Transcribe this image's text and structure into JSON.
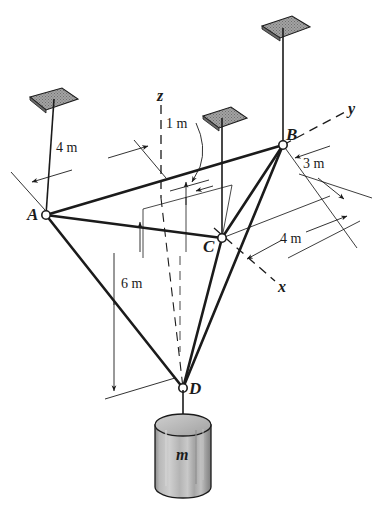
{
  "figure": {
    "background_color": "#ffffff",
    "line_color": "#1b1b1b",
    "plate_fill_color": "#9a9a9a",
    "cylinder_fill_color": "#b5b5b5"
  },
  "points": {
    "a": {
      "label": "A",
      "x": 46,
      "y": 215
    },
    "b": {
      "label": "B",
      "x": 283,
      "y": 145
    },
    "c": {
      "label": "C",
      "x": 222,
      "y": 238
    },
    "d": {
      "label": "D",
      "x": 183,
      "y": 388
    }
  },
  "axes": [
    {
      "name": "z-axis",
      "label": "z",
      "x": 161,
      "y": 97
    },
    {
      "name": "y-axis",
      "label": "y",
      "x": 351,
      "y": 110
    },
    {
      "name": "x-axis",
      "label": "x",
      "x": 281,
      "y": 287
    }
  ],
  "dimensions": [
    {
      "name": "dim-4m-ab",
      "label": "4 m",
      "x": 73,
      "y": 148
    },
    {
      "name": "dim-1m-offset",
      "label": "1 m",
      "x": 169,
      "y": 124
    },
    {
      "name": "dim-3m-b",
      "label": "3 m",
      "x": 315,
      "y": 165
    },
    {
      "name": "dim-4m-x",
      "label": "4 m",
      "x": 288,
      "y": 239
    },
    {
      "name": "dim-6m-depth",
      "label": "6 m",
      "x": 121,
      "y": 283
    }
  ],
  "mass": {
    "label": "m",
    "label_x": 176,
    "label_y": 455
  },
  "supports": [
    {
      "name": "ceiling-plate-left",
      "anchor_x": 54,
      "anchor_y": 101
    },
    {
      "name": "ceiling-plate-mid",
      "anchor_x": 222,
      "anchor_y": 120
    },
    {
      "name": "ceiling-plate-right",
      "anchor_x": 283,
      "anchor_y": 30
    }
  ],
  "members": [
    {
      "name": "cable-a-b",
      "from": "A",
      "to": "B"
    },
    {
      "name": "cable-a-c",
      "from": "A",
      "to": "C"
    },
    {
      "name": "cable-b-c",
      "from": "B",
      "to": "C"
    },
    {
      "name": "cable-a-d",
      "from": "A",
      "to": "D"
    },
    {
      "name": "cable-b-d",
      "from": "B",
      "to": "D"
    },
    {
      "name": "cable-c-d",
      "from": "C",
      "to": "D"
    },
    {
      "name": "cable-d-mass",
      "from": "D",
      "to": "m"
    }
  ]
}
